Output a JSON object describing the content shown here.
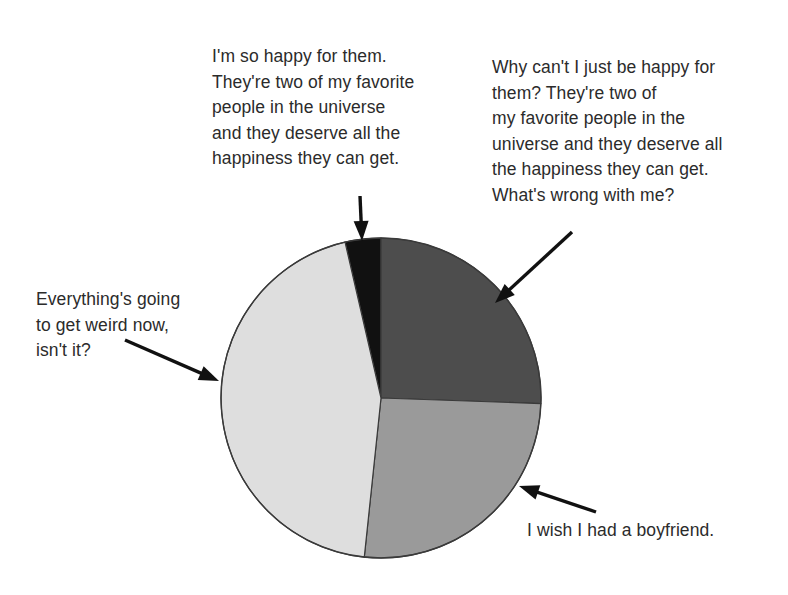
{
  "figure": {
    "type": "pie-chart-cartoon",
    "background_color": "#ffffff",
    "text_color": "#2b2b2b"
  },
  "captions": {
    "top_left": "I'm so happy for them.\nThey're two of my favorite\npeople in the universe\nand they deserve all the\nhappiness they can get.",
    "top_right": "Why can't I just be happy for\nthem? They're two of\nmy favorite people in the\nuniverse and they deserve all\nthe happiness they can get.\nWhat's wrong with me?",
    "left": "Everything's going\nto get weird now,\nisn't it?",
    "bottom_right": "I wish I had a boyfriend."
  },
  "chart_data": {
    "type": "pie",
    "title": "",
    "subtitle": "",
    "xlabel": "",
    "ylabel": "",
    "grid": false,
    "legend_position": "callout-annotations",
    "center": {
      "x": 381,
      "y": 398
    },
    "radius": 160,
    "start_angle_deg": -90,
    "direction": "clockwise",
    "outline_color": "#3a3a3a",
    "categories": [
      "I'm so happy for them. They're two of my favorite people in the universe and they deserve all the happiness they can get.",
      "Why can't I just be happy for them? They're two of my favorite people in the universe and they deserve all the happiness they can get. What's wrong with me?",
      "I wish I had a boyfriend.",
      "Everything's going to get weird now, isn't it?"
    ],
    "short_labels": [
      "so happy for them",
      "why can't I just be happy",
      "wish I had a boyfriend",
      "everything's going to get weird"
    ],
    "values": [
      3.6,
      25.6,
      26.1,
      44.7
    ],
    "value_unit": "percent",
    "colors": [
      "#111111",
      "#4d4d4d",
      "#9a9a9a",
      "#dedede"
    ],
    "slice_angles_deg": [
      {
        "start": 347,
        "end": 360
      },
      {
        "start": 0,
        "end": 92
      },
      {
        "start": 92,
        "end": 186
      },
      {
        "start": 186,
        "end": 347
      }
    ],
    "annotations": [
      {
        "label": "arrow-to-black-slice",
        "target_slice": 0,
        "from": {
          "x": 360,
          "y": 196
        },
        "to": {
          "x": 362,
          "y": 241
        }
      },
      {
        "label": "arrow-to-dark-gray-slice",
        "target_slice": 1,
        "from": {
          "x": 572,
          "y": 232
        },
        "to": {
          "x": 495,
          "y": 303
        }
      },
      {
        "label": "arrow-to-medium-gray-slice",
        "target_slice": 2,
        "from": {
          "x": 596,
          "y": 512
        },
        "to": {
          "x": 519,
          "y": 486
        }
      },
      {
        "label": "arrow-to-light-gray-slice",
        "target_slice": 3,
        "from": {
          "x": 125,
          "y": 340
        },
        "to": {
          "x": 219,
          "y": 381
        }
      }
    ]
  }
}
